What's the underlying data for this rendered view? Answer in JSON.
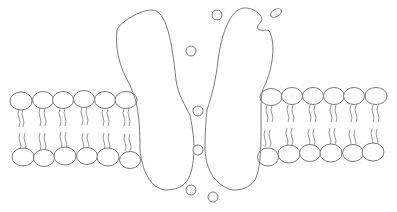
{
  "diagram": {
    "title": "",
    "colors": {
      "background": "#ffffff",
      "line": "#7a7a7a"
    },
    "labels": [],
    "elements": {
      "bilayer_left": {
        "upper_heads": 6,
        "lower_heads": 6
      },
      "bilayer_right": {
        "upper_heads": 6,
        "lower_heads": 6
      },
      "protein_subunits": 2,
      "ions": 7
    }
  }
}
